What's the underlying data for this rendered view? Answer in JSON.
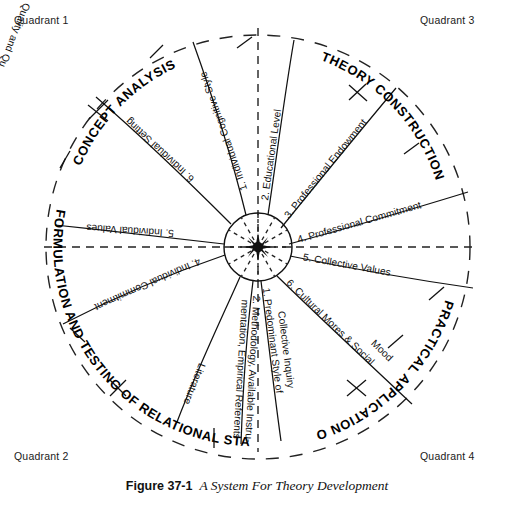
{
  "figure": {
    "caption_number": "Figure 37-1",
    "caption_title": "A System For Theory Development"
  },
  "quadrant_corner_labels": {
    "top_left": "Quadrant 1",
    "top_right": "Quadrant 3",
    "bottom_left": "Quadrant 2",
    "bottom_right": "Quadrant 4"
  },
  "sector_labels": [
    {
      "id": "concept-analysis",
      "text": "CONCEPT ANALYSIS"
    },
    {
      "id": "theory-construction",
      "text": "THEORY CONSTRUCTION"
    },
    {
      "id": "practical-application",
      "text": "PRACTICAL APPLICATION OF THEORY"
    },
    {
      "id": "formulation-testing",
      "text": "FORMULATION AND TESTING OF RELATIONAL STATEMENTS"
    }
  ],
  "chart_data": {
    "type": "diagram",
    "title": "A System For Theory Development",
    "center": {
      "cx": 258,
      "cy": 247,
      "inner_radius": 34,
      "outer_radius": 212
    },
    "quadrants": [
      {
        "name": "Quadrant 1",
        "sector": "CONCEPT ANALYSIS"
      },
      {
        "name": "Quadrant 3",
        "sector": "THEORY CONSTRUCTION"
      },
      {
        "name": "Quadrant 4",
        "sector": "PRACTICAL APPLICATION OF THEORY"
      },
      {
        "name": "Quadrant 2",
        "sector": "FORMULATION AND TESTING OF RELATIONAL STATEMENTS"
      }
    ],
    "spokes": [
      {
        "n": 1,
        "label": "1. Individual Cognitive Style",
        "angle_deg": -111,
        "quadrant": "Quadrant 1",
        "flip": true
      },
      {
        "n": 6,
        "label": "6. Individual Setting",
        "angle_deg": -139,
        "quadrant": "Quadrant 1",
        "flip": true
      },
      {
        "n": 5,
        "label": "5. Individual Values",
        "angle_deg": -176,
        "quadrant": "Quadrant 1",
        "flip": true
      },
      {
        "n": 4,
        "label": "4. Individual Commitment",
        "angle_deg": 158,
        "quadrant": "Quadrant 2",
        "flip": true
      },
      {
        "n": 3,
        "label": "3. Quality and Quantity of Literature",
        "angle_deg": 118,
        "quadrant": "Quadrant 2",
        "flip": true
      },
      {
        "n": 2,
        "label": "2. Methodology, Available Instrumentation, Empirical Referents",
        "angle_deg": 94,
        "quadrant": "Quadrant 2",
        "flip": true
      },
      {
        "n": 2,
        "label": "2. Educational Level",
        "angle_deg": -76,
        "quadrant": "Quadrant 3",
        "flip": false
      },
      {
        "n": 3,
        "label": "3. Professional Endowment",
        "angle_deg": -48,
        "quadrant": "Quadrant 3",
        "flip": false
      },
      {
        "n": 4,
        "label": "4. Professional Commitment",
        "angle_deg": -17,
        "quadrant": "Quadrant 3",
        "flip": false
      },
      {
        "n": 5,
        "label": "5. Collective Values",
        "angle_deg": 6,
        "quadrant": "Quadrant 4",
        "flip": false
      },
      {
        "n": 6,
        "label": "6. Cultural Mores & Social Mood",
        "angle_deg": 32,
        "quadrant": "Quadrant 4",
        "flip": false
      },
      {
        "n": 1,
        "label": "1. Predominant Style of Collective Inquiry",
        "angle_deg": 62,
        "quadrant": "Quadrant 4",
        "flip": false
      }
    ],
    "axes": {
      "horizontal_dashed": true,
      "vertical_dashed": true
    },
    "outer_boundary": "dashed circle"
  },
  "items": {
    "q1_cognitive_style": "1. Individual Cognitive Style",
    "q1_individual_setting": "6. Individual Setting",
    "q1_individual_values": "5. Individual Values",
    "q2_individual_commitment": "4. Individual Commitment",
    "q2_quality_quantity_lit_a": "3. Quality and Quantity of",
    "q2_quality_quantity_lit_b": "Literature",
    "q2_methodology_a": "2. Methodology, Available Instru-",
    "q2_methodology_b": "mentation, Empirical Referents",
    "q3_educational_level": "2. Educational Level",
    "q3_professional_endowment": "3. Professional Endowment",
    "q3_professional_commitment": "4. Professional Commitment",
    "q4_collective_values": "5. Collective Values",
    "q4_cultural_mores_a": "6. Cultural Mores & Social",
    "q4_cultural_mores_b": "Mood",
    "q4_predominant_style_a": "1. Predominant Style of",
    "q4_predominant_style_b": "Collective Inquiry"
  }
}
